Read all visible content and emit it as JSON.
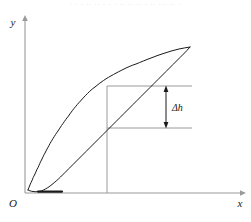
{
  "figure": {
    "page_remnant_text": "· · · ·· ·· · · · ·· ·· ·· · ·· ··· ·· ·",
    "axes": {
      "x_label": "x",
      "y_label": "y",
      "origin_label": "O",
      "axis_color": "#9a9a9a",
      "x_axis": {
        "x_start": 25,
        "x_end": 243,
        "y": 193
      },
      "y_axis": {
        "y_start": 18,
        "y_end": 193,
        "x": 25
      }
    },
    "annotation": {
      "label": "Δh",
      "label_x": 172,
      "label_y": 111,
      "arrow_x": 166,
      "arrow_top_y": 86,
      "arrow_bottom_y": 128,
      "arrow_color": "#1a1a1a"
    },
    "reference_lines": {
      "color": "#9a9a9a",
      "vertical": {
        "x": 107,
        "y_top": 86,
        "y_bottom": 193
      },
      "horizontal_upper": {
        "y": 86,
        "x_start": 107,
        "x_end": 192
      },
      "horizontal_lower": {
        "y": 128,
        "x_start": 107,
        "x_end": 192
      }
    },
    "curve": {
      "name": "hysteresis-loop",
      "color": "#1a1a1a",
      "stroke_width": 1,
      "upper_branch_path": "M 28,190 C 29,186 31,183 32,180 L 34,176 C 35,172 36,170 38,167 L 40,162 C 41,158 43,156 44,152 L 47,147 C 48,143 50,141 52,138 L 55,133 C 57,130 58,127 60,124 L 63,119 C 65,115 67,113 69,110 L 72,105 C 74,101 77,99 79,96 L 83,91 C 86,88 88,86 91,83 L 95,79 C 98,76 101,74 104,72 L 108,69 C 112,66 115,64 119,62 L 124,59 C 129,56 134,54 139,52 L 146,50 C 153,48 160,47 167,46 L 176,46 C 182,46 187,46 190,47",
      "lower_branch_path": "M 190,47 C 188,49 185,51 182,54 L 177,58 C 173,61 170,64 166,67 L 161,71 C 157,74 154,77 150,80 L 145,85 C 141,88 138,91 134,94 L 129,99 C 125,102 122,105 118,109 L 113,114 C 109,117 106,120 102,124 L 97,129 C 93,132 90,135 86,139 L 81,144 C 77,148 74,151 70,155 L 65,160 C 61,164 58,167 54,171 L 49,176 C 46,180 43,183 40,186 L 36,189 C 34,191 31,192 28,190",
      "base_segment": {
        "x_start": 38,
        "x_end": 62,
        "y": 192
      }
    }
  }
}
